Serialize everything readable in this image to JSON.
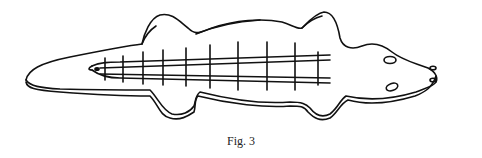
{
  "figure": {
    "caption": "Fig. 3",
    "stroke_color": "#111111",
    "background_color": "#ffffff"
  }
}
